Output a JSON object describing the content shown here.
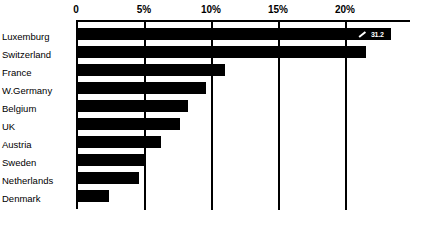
{
  "chart_data": {
    "type": "bar",
    "orientation": "horizontal",
    "title": "",
    "subtitle": "",
    "xlabel": "",
    "ylabel": "",
    "xlim": [
      0,
      24.5
    ],
    "grid": true,
    "legend": false,
    "legend_position": "none",
    "axis_position": "top",
    "tick_labels": [
      "0",
      "5%",
      "10%",
      "15%",
      "20%"
    ],
    "tick_values": [
      0,
      5,
      10,
      15,
      20
    ],
    "categories": [
      "Luxemburg",
      "Switzerland",
      "France",
      "W.Germany",
      "Belgium",
      "UK",
      "Austria",
      "Sweden",
      "Netherlands",
      "Denmark"
    ],
    "values": [
      23.1,
      21.3,
      10.9,
      9.5,
      8.2,
      7.6,
      6.2,
      5.1,
      4.6,
      2.4
    ],
    "annotations": [
      {
        "series_index": 0,
        "category": "Luxemburg",
        "label": "31.2",
        "style": "inverted-callout",
        "leader_line": true
      }
    ],
    "colors": {
      "bar": "#000000",
      "background": "#ffffff",
      "axis": "#000000",
      "grid": "#000000",
      "callout_text": "#ffffff"
    }
  }
}
